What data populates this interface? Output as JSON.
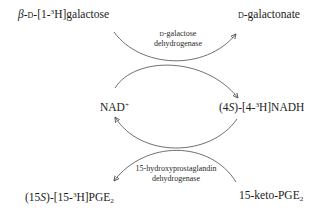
{
  "diagram": {
    "title": "",
    "nodes": {
      "galactose": {
        "prefix": "β-",
        "sc": "d",
        "mid": "-[1-",
        "sup": "3",
        "suffix": "H]galactose"
      },
      "galactonate": {
        "sc": "d",
        "suffix": "-galactonate"
      },
      "nad_plus": {
        "text": "NAD",
        "sup": "+"
      },
      "nadh": {
        "prefix": "(4",
        "italic": "S",
        "mid": ")-[4-",
        "sup": "3",
        "suffix": "H]NADH"
      },
      "pge2_labeled": {
        "prefix": "(15",
        "italic": "S",
        "mid": ")-[15-",
        "sup": "3",
        "suffix": "H]PGE",
        "sub": "2"
      },
      "keto_pge2": {
        "text": "15-keto-PGE",
        "sub": "2"
      }
    },
    "enzymes": {
      "top": {
        "line1_sc": "d",
        "line1": "-galactose",
        "line2": "dehydrogenase"
      },
      "bottom": {
        "line1": "15-hydroxyprostaglandin",
        "line2": "dehydrogenase"
      }
    },
    "edges": [
      {
        "from": "galactose",
        "to": "galactonate",
        "enzyme": "top"
      },
      {
        "from": "nad_plus",
        "to": "nadh",
        "enzyme": "top"
      },
      {
        "from": "nadh",
        "to": "nad_plus",
        "enzyme": "bottom"
      },
      {
        "from": "keto_pge2",
        "to": "pge2_labeled",
        "enzyme": "bottom"
      }
    ],
    "colors": {
      "line": "#4a4a4a",
      "text": "#1a1a1a",
      "background": "#ffffff"
    }
  }
}
